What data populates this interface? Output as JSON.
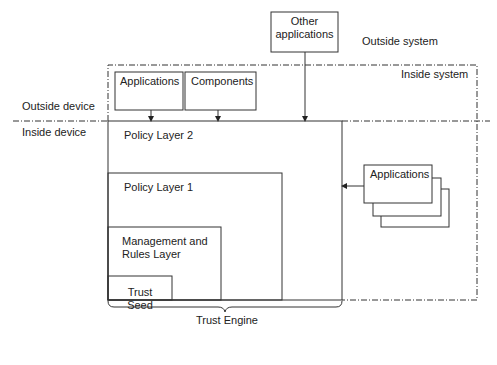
{
  "diagram": {
    "zones": {
      "outside_system": "Outside system",
      "inside_system": "Inside system",
      "outside_device": "Outside device",
      "inside_device": "Inside device"
    },
    "external_boxes": {
      "other_applications": "Other\napplications",
      "other_applications_line1": "Other",
      "other_applications_line2": "applications",
      "applications_top": "Applications",
      "components": "Components",
      "applications_stack": "Applications"
    },
    "layers": [
      {
        "name": "Policy Layer 2"
      },
      {
        "name": "Policy Layer 1"
      },
      {
        "name": "Management and Rules Layer",
        "line1": "Management and",
        "line2": "Rules Layer"
      },
      {
        "name": "Trust Seed",
        "line1": "Trust",
        "line2": "Seed"
      }
    ],
    "brace_label": "Trust Engine",
    "colors": {
      "line": "#333333",
      "background": "#ffffff"
    }
  }
}
